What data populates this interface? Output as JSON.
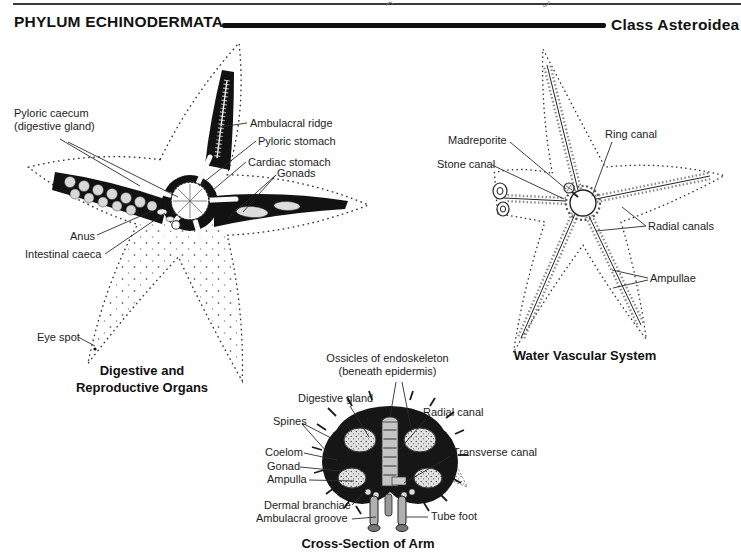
{
  "page": {
    "header": {
      "left_title": "PHYLUM ECHINODERMATA",
      "right_title": "Class Asteroidea"
    },
    "figures": {
      "digestive": {
        "caption_line1": "Digestive and",
        "caption_line2": "Reproductive Organs",
        "labels": {
          "pyloric_caecum_line1": "Pyloric caecum",
          "pyloric_caecum_line2": "(digestive gland)",
          "ambulacral_ridge": "Ambulacral ridge",
          "pyloric_stomach": "Pyloric stomach",
          "cardiac_stomach": "Cardiac stomach",
          "gonads": "Gonads",
          "anus": "Anus",
          "intestinal_caeca": "Intestinal caeca",
          "eye_spot": "Eye spot"
        }
      },
      "water_vascular": {
        "caption": "Water Vascular System",
        "labels": {
          "madreporite": "Madreporite",
          "stone_canal": "Stone canal",
          "ring_canal": "Ring canal",
          "radial_canals": "Radial canals",
          "ampullae": "Ampullae"
        }
      },
      "cross_section": {
        "caption": "Cross-Section of Arm",
        "labels": {
          "ossicles_line1": "Ossicles of endoskeleton",
          "ossicles_line2": "(beneath epidermis)",
          "digestive_gland": "Digestive gland",
          "spines": "Spines",
          "radial_canal": "Radial canal",
          "coelom": "Coelom",
          "gonad": "Gonad",
          "ampulla": "Ampulla",
          "transverse_canal": "Transverse canal",
          "dermal_branchiae": "Dermal branchiae",
          "ambulacral_groove": "Ambulacral groove",
          "tube_foot": "Tube foot"
        }
      }
    },
    "colors": {
      "ink": "#1a1a1a",
      "paper": "#ffffff"
    }
  }
}
